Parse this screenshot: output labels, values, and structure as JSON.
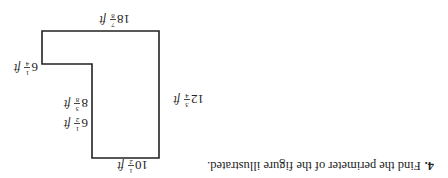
{
  "orientation": "rotated-180",
  "question": {
    "number": "4.",
    "text": "Find the perimeter of the figure illustrated."
  },
  "figure": {
    "shape": "L-shaped polygon (rectilinear)",
    "line_color": "#222222",
    "labels": {
      "bottom": {
        "whole": "10",
        "num": "1",
        "den": "2",
        "unit": "ft"
      },
      "right": {
        "whole": "12",
        "num": "3",
        "den": "4",
        "unit": "ft"
      },
      "left_lower": {
        "whole": "6",
        "num": "1",
        "den": "2",
        "unit": "ft"
      },
      "step_width": {
        "whole": "8",
        "num": "3",
        "den": "8",
        "unit": "ft"
      },
      "left_upper": {
        "whole": "6",
        "num": "1",
        "den": "4",
        "unit": "ft"
      },
      "top": {
        "whole": "18",
        "num": "7",
        "den": "8",
        "unit": "ft"
      }
    }
  }
}
